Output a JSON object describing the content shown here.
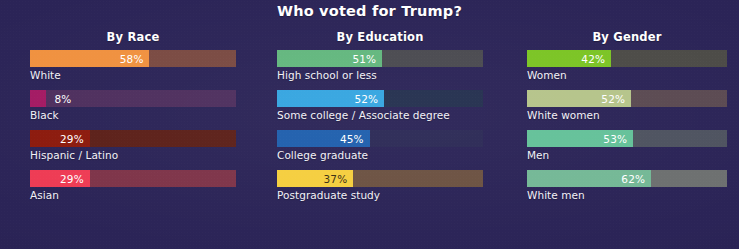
{
  "title": "Who voted for Trump?",
  "theme": {
    "background": "#2b2457",
    "title_color": "#ffffff",
    "label_color": "#f2f1f7"
  },
  "chart_data": {
    "type": "bar",
    "title": "Who voted for Trump?",
    "orientation": "horizontal",
    "xlabel": "",
    "ylabel": "",
    "xlim": [
      0,
      100
    ],
    "unit": "%",
    "grid": false,
    "legend": "none",
    "groups": [
      {
        "name": "By Race",
        "categories": [
          "White",
          "Black",
          "Hispanic / Latino",
          "Asian"
        ],
        "values": [
          58,
          8,
          29,
          29
        ],
        "value_labels": [
          "58%",
          "8%",
          "29%",
          "29%"
        ],
        "fill_colors": [
          "#f0913f",
          "#a31a63",
          "#8c1a0d",
          "#ee3b54"
        ],
        "track_colors": [
          "#7a4a42",
          "#4e2f5e",
          "#5c2019",
          "#7e3449"
        ],
        "value_text_colors": [
          "#ffffff",
          "#ffffff",
          "#ffffff",
          "#ffffff"
        ],
        "value_inside": [
          true,
          false,
          true,
          true
        ]
      },
      {
        "name": "By Education",
        "categories": [
          "High school or less",
          "Some college / Associate degree",
          "College graduate",
          "Postgraduate study"
        ],
        "values": [
          51,
          52,
          45,
          37
        ],
        "value_labels": [
          "51%",
          "52%",
          "45%",
          "37%"
        ],
        "fill_colors": [
          "#63b77e",
          "#35a5e0",
          "#1f5fad",
          "#f5ce3e"
        ],
        "track_colors": [
          "#4a4a50",
          "#24304f",
          "#2c2a56",
          "#6c5242"
        ],
        "value_text_colors": [
          "#ffffff",
          "#ffffff",
          "#ffffff",
          "#3a2f12"
        ],
        "value_inside": [
          true,
          true,
          true,
          true
        ]
      },
      {
        "name": "By Gender",
        "categories": [
          "Women",
          "White women",
          "Men",
          "White men"
        ],
        "values": [
          42,
          52,
          53,
          62
        ],
        "value_labels": [
          "42%",
          "52%",
          "53%",
          "62%"
        ],
        "fill_colors": [
          "#7bc424",
          "#b5c48a",
          "#64c199",
          "#74b896"
        ],
        "track_colors": [
          "#4c4b47",
          "#5b4a52",
          "#4e5360",
          "#6d7070"
        ],
        "value_text_colors": [
          "#ffffff",
          "#ffffff",
          "#ffffff",
          "#ffffff"
        ],
        "value_inside": [
          true,
          true,
          true,
          true
        ]
      }
    ]
  }
}
